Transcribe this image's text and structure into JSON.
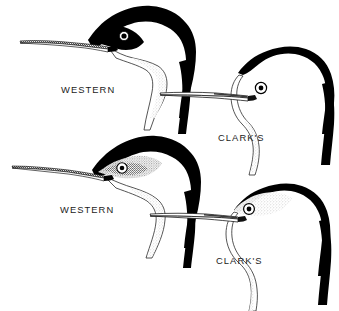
{
  "plate": {
    "title": "Western and Clark's Grebe head comparison",
    "background_color": "#ffffff",
    "ink_color": "#000000",
    "stipple_color": "#9a9a9a",
    "width": 339,
    "height": 311
  },
  "labels": {
    "western_top": "WESTERN",
    "clarks_top": "CLARK'S",
    "western_bottom": "WESTERN",
    "clarks_bottom": "CLARK'S"
  },
  "figures": [
    {
      "id": "western-breeding",
      "species_label": "WESTERN",
      "position": "upper-left",
      "plumage": "breeding",
      "eye_surround": "black",
      "bill_tone": "dark",
      "description": "Head profile facing left, black crown extends below and around the eye"
    },
    {
      "id": "clarks-breeding",
      "species_label": "CLARK'S",
      "position": "upper-right",
      "plumage": "breeding",
      "eye_surround": "white",
      "bill_tone": "pale",
      "description": "Head profile facing left, white lores so the eye sits in white"
    },
    {
      "id": "western-winter",
      "species_label": "WESTERN",
      "position": "lower-left",
      "plumage": "winter",
      "eye_surround": "dusky-gray",
      "bill_tone": "dark",
      "description": "Winter head profile facing left, eye within dusky stippled area"
    },
    {
      "id": "clarks-winter",
      "species_label": "CLARK'S",
      "position": "lower-right",
      "plumage": "winter",
      "eye_surround": "pale-gray",
      "bill_tone": "pale",
      "description": "Winter head profile facing left, eye ringed by pale gray stippling"
    }
  ],
  "caption": {
    "text": ""
  }
}
